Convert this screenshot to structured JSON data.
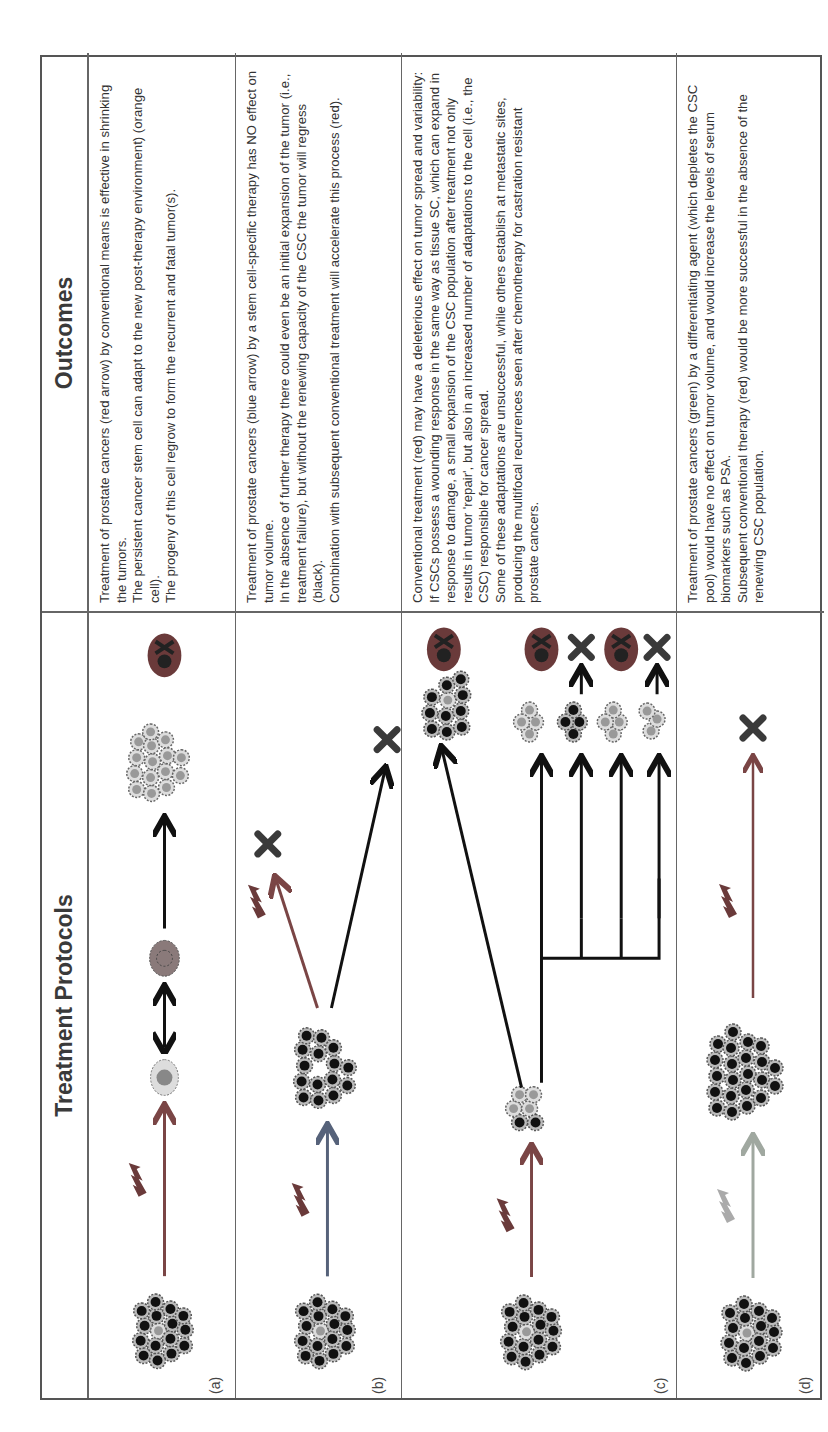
{
  "headers": {
    "treatment": "Treatment Protocols",
    "outcomes": "Outcomes"
  },
  "colors": {
    "conventional_arrow": "#8a4a4a",
    "stem_specific_arrow": "#5a6a8a",
    "differentiating_arrow": "#9aaa9a",
    "black_arrow": "#111111",
    "tumor_cell_dark": "#111111",
    "csc_orange": "#b58a6a",
    "fatal_tumor": "#6a3a3a"
  },
  "rows": [
    {
      "label": "(a)",
      "outcome_lines": [
        "Treatment of prostate cancers (red arrow) by conventional means is effective in shrinking the tumors.",
        "The persistent cancer stem cell can adapt to the new post-therapy environment) (orange cell).",
        "The progeny of this cell regrow to form the recurrent and fatal tumor(s)."
      ],
      "diagram": [
        "tumor",
        "red-arrow-with-lightning",
        "surviving-stem-cell",
        "double-arrow",
        "adapted-orange-cell",
        "arrow",
        "recurrent-tumor",
        "fatal-skull"
      ]
    },
    {
      "label": "(b)",
      "outcome_lines": [
        "Treatment of prostate cancers (blue arrow) by a stem cell-specific therapy has NO effect on tumor volume.",
        "In the absence of further therapy there could even be an initial expansion of the tumor (i.e., treatment failure), but without the renewing capacity of the CSC the tumor will regress (black).",
        "Combination with subsequent conventional treatment will accelerate this process (red)."
      ],
      "diagram": [
        "tumor",
        "blue-arrow-with-lightning",
        "tumor-without-csc",
        "red-arrow-with-lightning",
        "regression-x",
        "black-arrow",
        "regression-x"
      ]
    },
    {
      "label": "(c)",
      "outcome_lines": [
        "Conventional treatment (red) may have a deleterious effect on tumor spread and  variability:",
        "If CSCs possess a wounding response in the same way as tissue SC, which can expand in response to damage, a small expansion of the CSC population after treatment not only results in tumor 'repair', but also in an increased number of adaptations to the cell (i.e., the CSC) responsible for cancer spread.",
        "Some of these adaptations are unsuccessful, while others establish at metastatic sites, producing the multifocal recurrences seen after chemotherapy for castration resistant prostate cancers."
      ],
      "diagram": [
        "tumor",
        "red-arrow-with-lightning",
        "expanded-csc-cluster",
        "branching-arrows",
        "metastatic-foci",
        "fatal-skull",
        "regression-x",
        "fatal-skull",
        "regression-x"
      ]
    },
    {
      "label": "(d)",
      "outcome_lines": [
        "Treatment of prostate cancers (green) by a differentiating agent (which depletes the CSC pool) would have no effect on tumor volume, and would increase the levels of serum biomarkers such as PSA.",
        "Subsequent conventional therapy (red) would be more successful in the absence of the renewing CSC population."
      ],
      "diagram": [
        "tumor",
        "green-arrow-with-lightning",
        "differentiated-tumor",
        "red-arrow-with-lightning",
        "regression-x"
      ]
    }
  ]
}
